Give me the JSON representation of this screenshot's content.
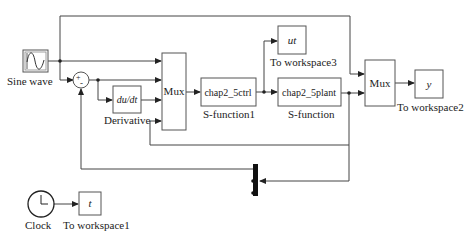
{
  "diagram": {
    "type": "simulink-block-diagram",
    "blocks": {
      "sine": {
        "label": "Sine wave"
      },
      "sum": {
        "signs": "+-"
      },
      "derivative": {
        "text": "du/dt",
        "label": "Derivative"
      },
      "mux1": {
        "text": "Mux"
      },
      "ctrl": {
        "text": "chap2_5ctrl",
        "label": "S-function1"
      },
      "ws3": {
        "text": "ut",
        "label": "To workspace3"
      },
      "plant": {
        "text": "chap2_5plant",
        "label": "S-function"
      },
      "mux2": {
        "text": "Mux"
      },
      "ws2": {
        "text": "y",
        "label": "To workspace2"
      },
      "clock": {
        "label": "Clock"
      },
      "ws1": {
        "text": "t",
        "label": "To workspace1"
      },
      "demux": {
        "label": ""
      }
    },
    "colors": {
      "line": "#444444",
      "block_border": "#555555",
      "background": "#ffffff"
    }
  }
}
